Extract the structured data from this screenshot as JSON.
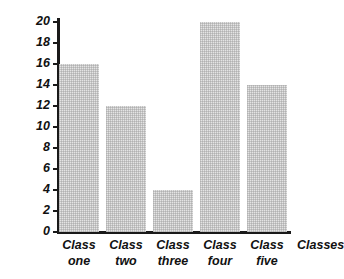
{
  "chart_data": {
    "type": "bar",
    "title": "",
    "subtitle": "",
    "xlabel": "Classes",
    "ylabel": "Number of children",
    "categories": [
      "Class one",
      "Class two",
      "Class three",
      "Class four",
      "Class five"
    ],
    "category_lines": [
      [
        "Class",
        "one"
      ],
      [
        "Class",
        "two"
      ],
      [
        "Class",
        "three"
      ],
      [
        "Class",
        "four"
      ],
      [
        "Class",
        "five"
      ]
    ],
    "values": [
      16,
      12,
      4,
      20,
      14
    ],
    "ylim": [
      0,
      20
    ],
    "ytick_step": 2,
    "yticks": [
      20,
      18,
      16,
      14,
      12,
      10,
      8,
      6,
      4,
      2,
      0
    ],
    "ytick_labels": [
      "20",
      "18",
      "16",
      "14",
      "12",
      "10",
      "8",
      "6",
      "4",
      "2",
      "0"
    ],
    "grid": false,
    "legend": null,
    "bar_color": "#e4e4e4",
    "axis_color": "#1a1a1a",
    "text_color": "#111111",
    "background": "#ffffff"
  }
}
